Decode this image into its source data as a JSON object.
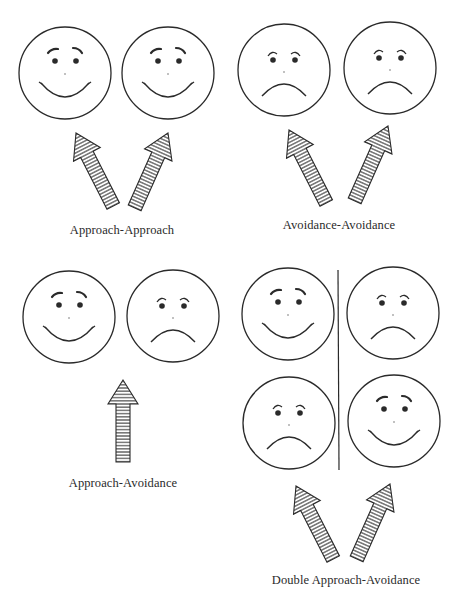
{
  "figure": {
    "panels": [
      {
        "id": "approach-approach",
        "label": "Approach-Approach",
        "faces": [
          "happy",
          "happy"
        ],
        "arrows": 2
      },
      {
        "id": "avoidance-avoidance",
        "label": "Avoidance-Avoidance",
        "faces": [
          "sad",
          "sad"
        ],
        "arrows": 2
      },
      {
        "id": "approach-avoidance",
        "label": "Approach-Avoidance",
        "faces": [
          "happy",
          "sad"
        ],
        "arrows": 1
      },
      {
        "id": "double-approach-avoidance",
        "label": "Double Approach-Avoidance",
        "faces": [
          "happy",
          "sad",
          "sad",
          "happy"
        ],
        "arrows": 2
      }
    ],
    "colors": {
      "ink": "#2a2a2a",
      "background": "#ffffff"
    }
  }
}
